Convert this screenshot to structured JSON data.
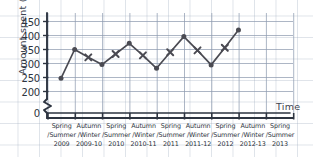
{
  "chart_data": {
    "type": "line",
    "title": "",
    "xlabel": "Time",
    "ylabel": "Amount spent (£)",
    "ylim": [
      200,
      450
    ],
    "yticks": [
      "0",
      "200",
      "250",
      "300",
      "350",
      "400",
      "450"
    ],
    "axis_break": true,
    "grid": true,
    "legend": "none",
    "categories": [
      "Spring\n/Summer\n2009",
      "Autumn\n/Winter\n2009-10",
      "Spring\n/Summer\n2010",
      "Autumn\n/Winter\n2010-11",
      "Spring\n/Summer\n2011",
      "Autumn\n/Winter\n2011-12",
      "Spring\n/Summer\n2012",
      "Autumn\n/Winter\n2012-13",
      "Spring\n/Summer\n2013"
    ],
    "points": [
      {
        "label": "Spring/Summer 2009",
        "value": 247,
        "marker": "dot"
      },
      {
        "label": "Autumn/Winter 2009-10",
        "value": 350,
        "marker": "dot"
      },
      {
        "label": "Spring 2010 mid",
        "value": 322,
        "marker": "cross"
      },
      {
        "label": "Spring/Summer 2010",
        "value": 296,
        "marker": "dot"
      },
      {
        "label": "Autumn 2010-11 mid",
        "value": 334,
        "marker": "cross"
      },
      {
        "label": "Autumn/Winter 2010-11",
        "value": 372,
        "marker": "dot"
      },
      {
        "label": "Spring 2011 mid",
        "value": 329,
        "marker": "cross"
      },
      {
        "label": "Spring/Summer 2011",
        "value": 283,
        "marker": "dot"
      },
      {
        "label": "Autumn 2011-12 mid",
        "value": 340,
        "marker": "cross"
      },
      {
        "label": "Autumn/Winter 2011-12",
        "value": 396,
        "marker": "dot"
      },
      {
        "label": "Spring 2012 mid",
        "value": 347,
        "marker": "cross"
      },
      {
        "label": "Spring/Summer 2012",
        "value": 295,
        "marker": "dot"
      },
      {
        "label": "Autumn 2012-13 mid",
        "value": 356,
        "marker": "cross"
      },
      {
        "label": "Autumn/Winter 2012-13",
        "value": 420,
        "marker": "dot"
      }
    ],
    "series_color": "#4a4a52",
    "grid_color": "#8e9bb0"
  },
  "axes": {
    "y_label": "Amount spent (£)",
    "x_label": "Time",
    "y_ticks": [
      "450",
      "400",
      "350",
      "300",
      "250",
      "200",
      "0"
    ]
  },
  "x_groups": [
    {
      "season": "Spring",
      "season2": "/Summer",
      "year": "2009"
    },
    {
      "season": "Autumn",
      "season2": "/Winter",
      "year": "2009-10"
    },
    {
      "season": "Spring",
      "season2": "/Summer",
      "year": "2010"
    },
    {
      "season": "Autumn",
      "season2": "/Winter",
      "year": "2010-11"
    },
    {
      "season": "Spring",
      "season2": "/Summer",
      "year": "2011"
    },
    {
      "season": "Autumn",
      "season2": "/Winter",
      "year": "2011-12"
    },
    {
      "season": "Spring",
      "season2": "/Summer",
      "year": "2012"
    },
    {
      "season": "Autumn",
      "season2": "/Winter",
      "year": "2012-13"
    },
    {
      "season": "Spring",
      "season2": "/Summer",
      "year": "2013"
    }
  ]
}
